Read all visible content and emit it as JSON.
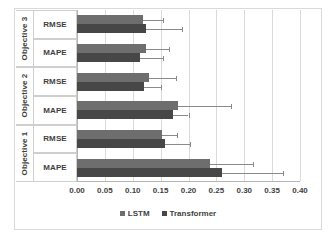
{
  "chart_data": {
    "type": "bar",
    "orientation": "horizontal",
    "title": "",
    "xlabel": "",
    "ylabel": "",
    "xlim": [
      0.0,
      0.4
    ],
    "xticks": [
      "0.00",
      "0.05",
      "0.10",
      "0.15",
      "0.20",
      "0.25",
      "0.30",
      "0.35",
      "0.40"
    ],
    "xtick_values": [
      0.0,
      0.05,
      0.1,
      0.15,
      0.2,
      0.25,
      0.3,
      0.35,
      0.4
    ],
    "grid": true,
    "legend_position": "bottom",
    "groups": [
      "Objective 1",
      "Objective 2",
      "Objective 3"
    ],
    "metrics": [
      "MAPE",
      "RMSE"
    ],
    "categories": [
      "Objective 1 MAPE",
      "Objective 1 RMSE",
      "Objective 2 MAPE",
      "Objective 2 RMSE",
      "Objective 3 MAPE",
      "Objective 3 RMSE"
    ],
    "series": [
      {
        "name": "LSTM",
        "color": "#6e6e6e",
        "values": [
          0.238,
          0.152,
          0.181,
          0.129,
          0.124,
          0.118
        ],
        "errors_upper": [
          0.316,
          0.18,
          0.277,
          0.178,
          0.165,
          0.155
        ]
      },
      {
        "name": "Transformer",
        "color": "#474747",
        "values": [
          0.26,
          0.158,
          0.172,
          0.12,
          0.113,
          0.124
        ],
        "errors_upper": [
          0.369,
          0.203,
          0.2,
          0.15,
          0.155,
          0.188
        ]
      }
    ]
  },
  "axis": {
    "objectives": [
      {
        "label": "Objective 3",
        "metrics": [
          "RMSE",
          "MAPE"
        ]
      },
      {
        "label": "Objective 2",
        "metrics": [
          "RMSE",
          "MAPE"
        ]
      },
      {
        "label": "Objective 1",
        "metrics": [
          "RMSE",
          "MAPE"
        ]
      }
    ]
  },
  "legend": {
    "items": [
      {
        "label": "LSTM",
        "color": "#6e6e6e"
      },
      {
        "label": "Transformer",
        "color": "#474747"
      }
    ]
  },
  "colors": {
    "lstm": "#6e6e6e",
    "transformer": "#474747",
    "grid": "#dadada",
    "axis": "#b5b5b5",
    "error": "#8a8a8a",
    "text": "#3f3f3f",
    "background": "#ffffff"
  }
}
